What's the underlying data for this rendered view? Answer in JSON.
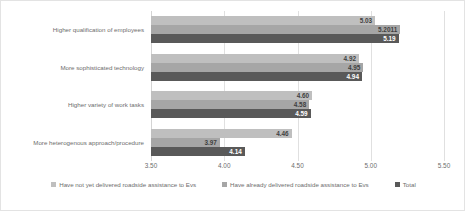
{
  "chart_data": {
    "type": "bar",
    "orientation": "horizontal",
    "title": "",
    "subtitle": "",
    "xlabel": "",
    "ylabel": "",
    "xlim": [
      3.5,
      5.5
    ],
    "grid": true,
    "legend_position": "bottom",
    "tick_labels": [
      "3.50",
      "4.00",
      "4.50",
      "5.00",
      "5.50"
    ],
    "ticks": [
      3.5,
      4.0,
      4.5,
      5.0,
      5.5
    ],
    "categories": [
      "Higher qualification of employees",
      "More sophisticated technology",
      "Higher variety of work tasks",
      "More heterogenous approach/procedure"
    ],
    "series": [
      {
        "name": "Have not yet delivered roadside assistance to Evs",
        "color": "#bfbfbf",
        "values": [
          5.03,
          4.92,
          4.6,
          4.46
        ],
        "labels": [
          "5.03",
          "4.92",
          "4.60",
          "4.46"
        ]
      },
      {
        "name": "Have already delivered roadside assistance to Evs",
        "color": "#a6a6a6",
        "values": [
          5.2011,
          4.95,
          4.58,
          3.97
        ],
        "labels": [
          "5.2011",
          "4.95",
          "4.58",
          "3.97"
        ]
      },
      {
        "name": "Total",
        "color": "#595959",
        "values": [
          5.19,
          4.94,
          4.59,
          4.14
        ],
        "labels": [
          "5.19",
          "4.94",
          "4.59",
          "4.14"
        ]
      }
    ]
  }
}
